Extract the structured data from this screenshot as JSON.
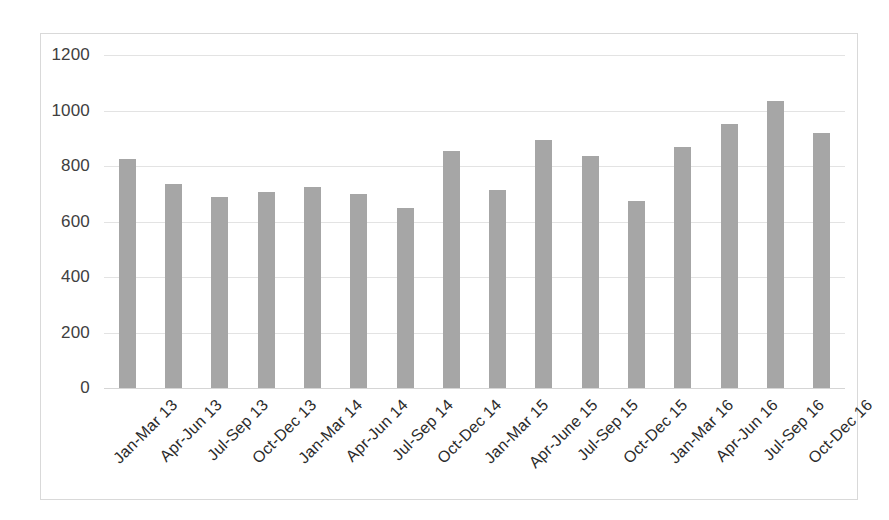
{
  "chart_data": {
    "type": "bar",
    "title": "",
    "subtitle": "",
    "xlabel": "",
    "ylabel": "",
    "ylim": [
      0,
      1200
    ],
    "yticks": [
      0,
      200,
      400,
      600,
      800,
      1000,
      1200
    ],
    "ytick_labels": [
      "0",
      "200",
      "400",
      "600",
      "800",
      "1000",
      "1200"
    ],
    "grid": true,
    "legend": false,
    "legend_position": "none",
    "bar_color": "#a6a6a6",
    "gridline_color": "#e3e3e3",
    "axis_text_color": "#404040",
    "categories": [
      "Jan-Mar 13",
      "Apr-Jun 13",
      "Jul-Sep 13",
      "Oct-Dec 13",
      "Jan-Mar 14",
      "Apr-Jun 14",
      "Jul-Sep 14",
      "Oct-Dec 14",
      "Jan-Mar 15",
      "Apr-June 15",
      "Jul-Sep 15",
      "Oct-Dec 15",
      "Jan-Mar 16",
      "Apr-Jun 16",
      "Jul-Sep 16",
      "Oct-Dec 16"
    ],
    "values": [
      825,
      735,
      690,
      705,
      725,
      700,
      650,
      855,
      715,
      895,
      835,
      675,
      870,
      950,
      1035,
      920
    ]
  }
}
